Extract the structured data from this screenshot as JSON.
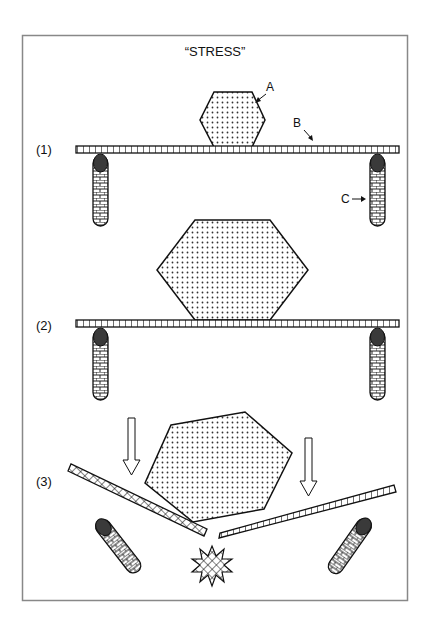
{
  "title": "“STRESS”",
  "stages": [
    {
      "label": "(1)",
      "description": "small block A resting on beam B supported by pillars C"
    },
    {
      "label": "(2)",
      "description": "large block resting on beam supported by pillars"
    },
    {
      "label": "(3)",
      "description": "beam breaks under large block, pillars fall, collision burst"
    }
  ],
  "callouts": {
    "a": "A",
    "b": "B",
    "c": "C"
  },
  "colors": {
    "stroke": "#111111",
    "frame": "#888888",
    "cap": "#3a3a3a",
    "background": "#ffffff"
  }
}
